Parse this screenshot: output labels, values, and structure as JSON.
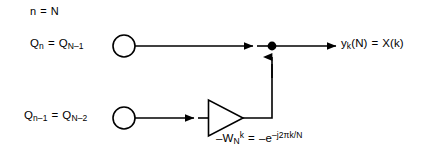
{
  "diagram": {
    "width": 430,
    "height": 162,
    "background_color": "#ffffff",
    "stroke_color": "#000000",
    "text_color": "#000000",
    "stroke_width": 1.6
  },
  "labels": {
    "iteration": {
      "full_text": "n = N",
      "lhs": "n",
      "eq": "=",
      "rhs": "N"
    },
    "state_top": {
      "full_text": "Qn = QN-1",
      "sym1": "Q",
      "sym1_sub": "n",
      "eq": "=",
      "sym2": "Q",
      "sym2_sub": "N–1"
    },
    "state_bottom": {
      "full_text": "Qn-1 = QN-2",
      "sym1": "Q",
      "sym1_sub": "n–1",
      "eq": "=",
      "sym2": "Q",
      "sym2_sub": "N–2"
    },
    "output": {
      "full_text": "yk(N) = X(k)",
      "sym1": "y",
      "sym1_sub": "k",
      "sym1_arg": "(N)",
      "eq": "=",
      "rhs": "X(k)"
    },
    "coefficient": {
      "full_text": "-WNk = -e-j2πk/N",
      "gain_sign": "–",
      "gain_sym": "W",
      "gain_sub": "N",
      "gain_sup": "k",
      "eq": "=",
      "rhs_sign": "–",
      "rhs_base": "e",
      "rhs_exponent": "–j2πk/N"
    }
  },
  "nodes": {
    "input_top": {
      "kind": "open-circle",
      "cx": 124,
      "cy": 46,
      "r": 11
    },
    "input_bottom": {
      "kind": "open-circle",
      "cx": 124,
      "cy": 118,
      "r": 11
    },
    "summing_junction": {
      "kind": "filled-dot",
      "cx": 272,
      "cy": 46,
      "r": 4.4
    },
    "amplifier": {
      "kind": "triangle-right",
      "x1": 208,
      "y_top": 100,
      "y_bottom": 136,
      "tip_x": 243,
      "tip_y": 118
    }
  },
  "edges": [
    {
      "name": "top-feedforward",
      "from": "input_top",
      "to": "summing_junction",
      "arrowhead": true
    },
    {
      "name": "summing-to-output",
      "from": "summing_junction",
      "to": "output_terminal",
      "arrowhead": true
    },
    {
      "name": "bottom-to-amplifier",
      "from": "input_bottom",
      "to": "amplifier",
      "arrowhead": true
    },
    {
      "name": "amplifier-to-summing",
      "from": "amplifier",
      "to": "summing_junction",
      "arrowhead": true
    }
  ]
}
